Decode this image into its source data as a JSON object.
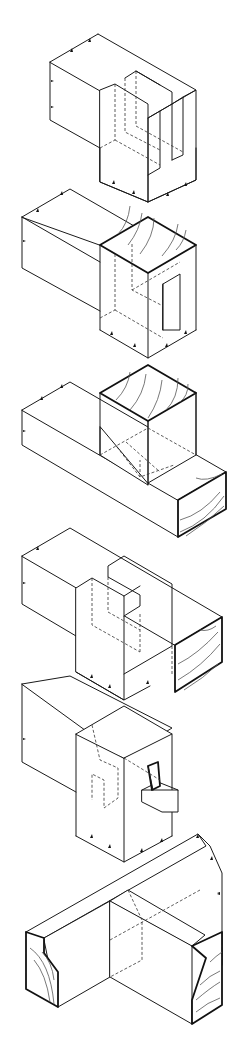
{
  "figure": {
    "type": "technical-illustration",
    "background": "#ffffff",
    "line_color": "#1a1a1a",
    "joints": [
      {
        "index": 1,
        "name": "bridle-joint",
        "description": "Open slot / bridle joint with twin tenons, hidden lines dashed"
      },
      {
        "index": 2,
        "name": "mortise-and-tenon-corner",
        "description": "Corner joint with end grain top and stub tenon"
      },
      {
        "index": 3,
        "name": "t-halving-joint",
        "description": "Post on beam with end-grain faces and dashed hidden housing"
      },
      {
        "index": 4,
        "name": "t-bridle-joint",
        "description": "Tee bridle joint through beam with end grain"
      },
      {
        "index": 5,
        "name": "wedged-through-tenon",
        "description": "Through tenon secured with wedge / pin"
      },
      {
        "index": 6,
        "name": "moulded-frame-joint",
        "description": "Chamfered/moulded rail crossing joint with end grain"
      }
    ]
  }
}
